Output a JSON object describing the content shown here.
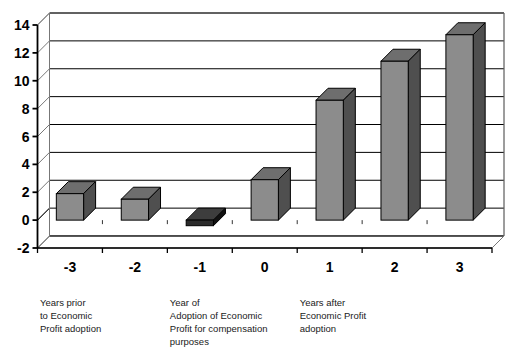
{
  "chart_data": {
    "type": "bar",
    "title": "",
    "subtitle": "",
    "xlabel": "",
    "ylabel": "",
    "categories": [
      "-3",
      "-2",
      "-1",
      "0",
      "1",
      "2",
      "3"
    ],
    "values": [
      1.9,
      1.5,
      -0.4,
      2.9,
      8.6,
      11.4,
      13.3
    ],
    "ylim": [
      -2,
      14
    ],
    "yticks": [
      -2,
      0,
      2,
      4,
      6,
      8,
      10,
      12,
      14
    ],
    "ytick_labels": [
      "-2",
      "0",
      "2",
      "4",
      "6",
      "8",
      "10",
      "12",
      "14"
    ],
    "grid": true,
    "legend": "none",
    "style": "3d-column",
    "annotations": [
      {
        "id": "years-prior",
        "lines": [
          "Years prior",
          "to Economic",
          "Profit adoption"
        ],
        "anchor_category": "-3"
      },
      {
        "id": "year-of-adoption",
        "lines": [
          "Year of",
          "Adoption of Economic",
          "Profit for compensation",
          "purposes"
        ],
        "anchor_category": "-1"
      },
      {
        "id": "years-after",
        "lines": [
          "Years  after",
          "Economic Profit",
          "adoption"
        ],
        "anchor_category": "1"
      }
    ]
  },
  "colors": {
    "bar_front": "#8c8c8c",
    "bar_side": "#4f4f4f",
    "bar_top": "#6e6e6e",
    "bar_negative_front": "#2b2b2b",
    "bar_negative_side": "#111111",
    "bar_negative_top": "#3d3d3d",
    "axis": "#000000",
    "grid": "#000000",
    "background": "#ffffff",
    "text": "#000000"
  }
}
